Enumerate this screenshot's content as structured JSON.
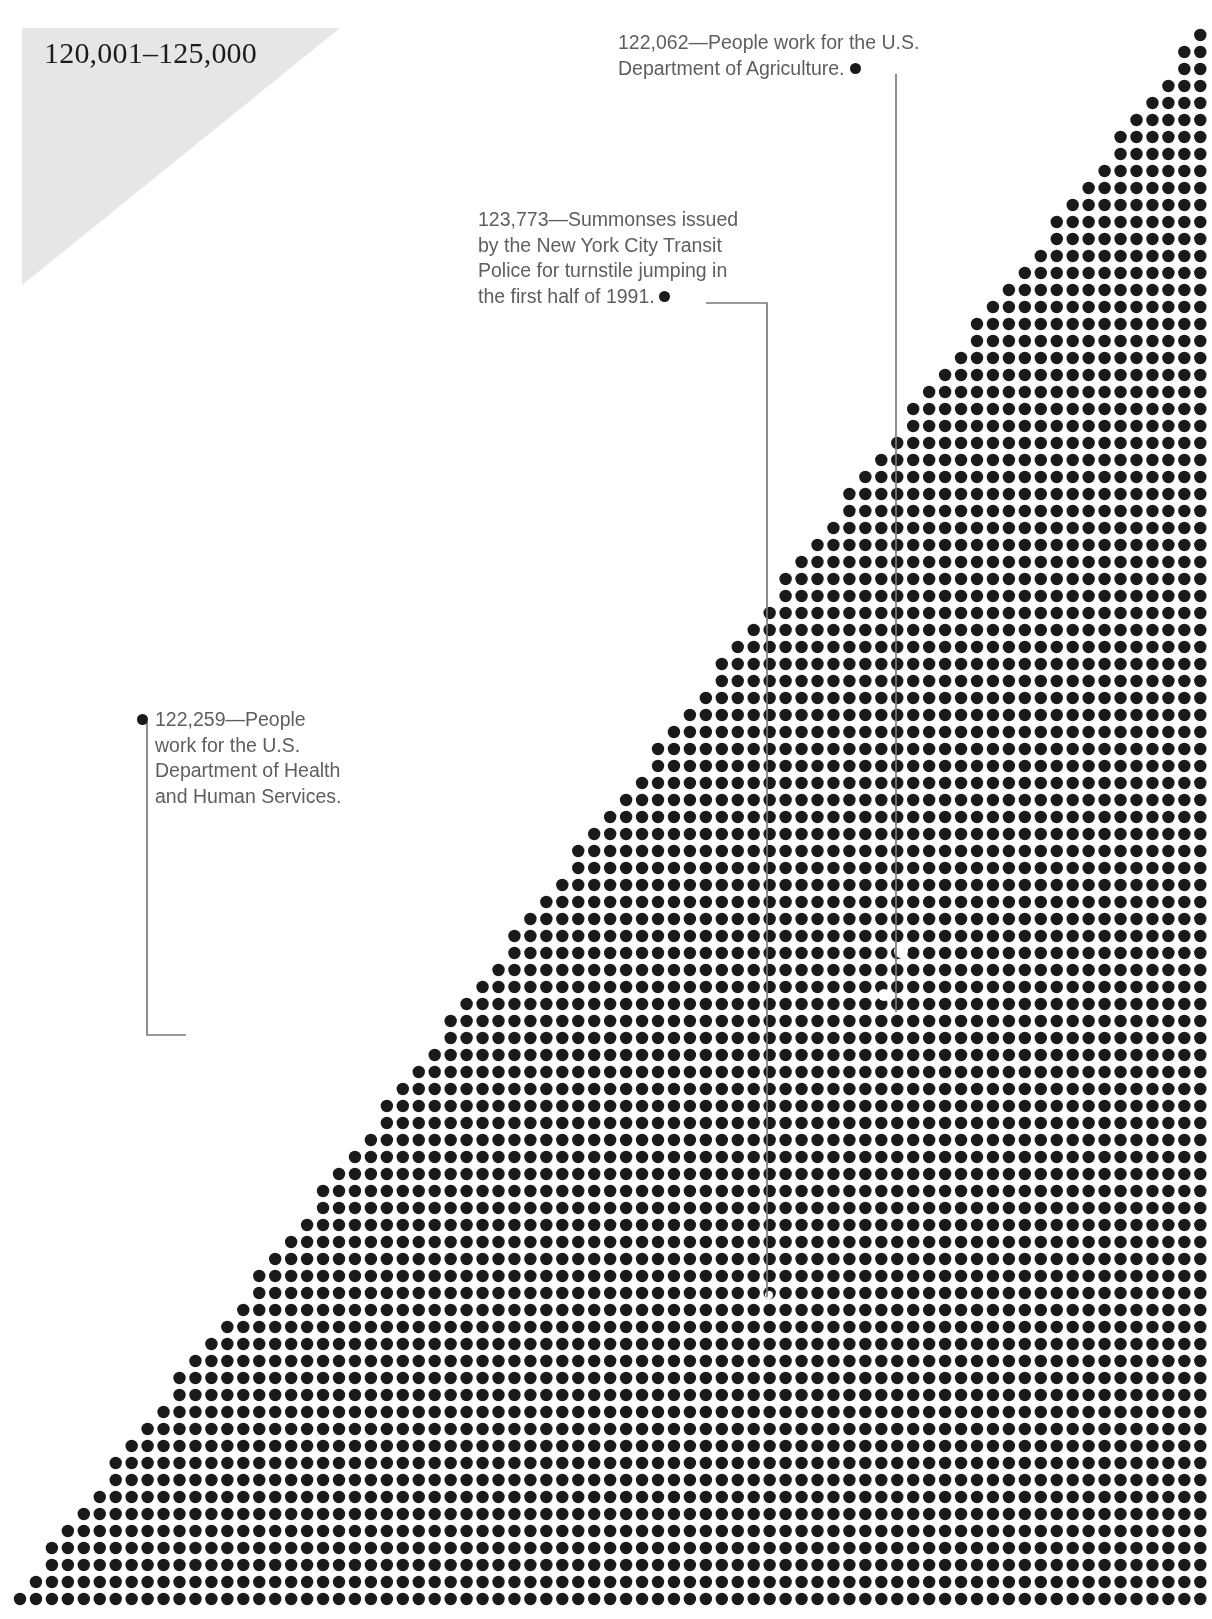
{
  "banner": {
    "title": "120,001–125,000",
    "background_color": "#e6e6e6"
  },
  "annotations": [
    {
      "id": "agriculture",
      "value": "122,062",
      "text": "122,062—People work for the U.S. Department of Agriculture.",
      "line1": "122,062—People work for the U.S.",
      "line2": "Department of Agriculture.",
      "bullet_side": "after",
      "text_color": "#5e5e5e"
    },
    {
      "id": "summonses",
      "value": "123,773",
      "text": "123,773—Summonses issued by the New York City Transit Police for turnstile jumping in the first half of 1991.",
      "line1": "123,773—Summonses issued",
      "line2": "by the New York City Transit",
      "line3": "Police for turnstile jumping in",
      "line4": "the first half of 1991.",
      "bullet_side": "after",
      "text_color": "#5e5e5e"
    },
    {
      "id": "health",
      "value": "122,259",
      "text": "122,259—People work for the U.S. Department of Health and Human Services.",
      "line1": "122,259—People",
      "line2": "work for the U.S.",
      "line3": "Department of Health",
      "line4": "and Human Services.",
      "bullet_side": "before",
      "text_color": "#5e5e5e"
    }
  ],
  "chart_data": {
    "type": "scatter",
    "title": "120,001–125,000",
    "dot_color": "#1a1a1a",
    "background_color": "#ffffff",
    "grid": {
      "columns": 75,
      "rows": 93,
      "origin_x": 20,
      "origin_y": 35,
      "step_x": 15.95,
      "step_y": 17.0,
      "dot_radius": 6.2
    },
    "fill_rule": "diagonal-staircase",
    "annotated_points": [
      {
        "label": "122,062",
        "note": "People work for the U.S. Department of Agriculture."
      },
      {
        "label": "123,773",
        "note": "Summonses issued by the New York City Transit Police for turnstile jumping in the first half of 1991."
      },
      {
        "label": "122,259",
        "note": "People work for the U.S. Department of Health and Human Services."
      }
    ],
    "xlabel": "",
    "ylabel": "",
    "legend": []
  },
  "leader_lines": {
    "color": "#7a7a7a",
    "width": 1.6
  }
}
